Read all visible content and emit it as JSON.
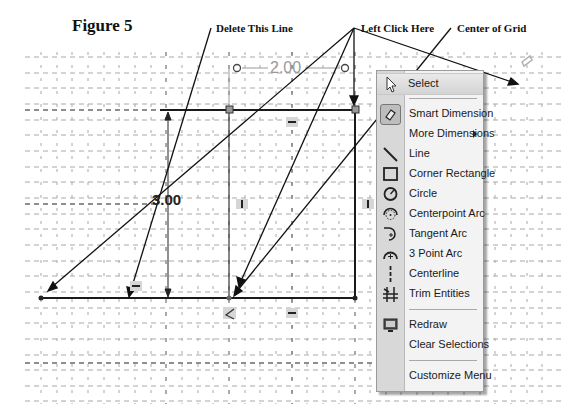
{
  "figure": {
    "title": "Figure 5"
  },
  "annotations": {
    "delete_line": "Delete This Line",
    "left_click": "Left Click Here",
    "center_grid": "Center of Grid"
  },
  "sketch": {
    "dimension_horizontal": "2.00",
    "dimension_vertical": "3.00",
    "line_color": "#1a1a1a",
    "grid_color": "#9a9a9a"
  },
  "context_menu": {
    "items": [
      {
        "label": "Select",
        "icon": "pointer-arrow-icon",
        "highlighted": true
      },
      {
        "label": "Smart Dimension",
        "icon": "smart-dimension-icon"
      },
      {
        "label": "More Dimensions",
        "icon": "",
        "submenu": true
      },
      {
        "label": "Line",
        "icon": "line-icon"
      },
      {
        "label": "Corner Rectangle",
        "icon": "rectangle-icon"
      },
      {
        "label": "Circle",
        "icon": "circle-icon"
      },
      {
        "label": "Centerpoint Arc",
        "icon": "centerpoint-arc-icon"
      },
      {
        "label": "Tangent Arc",
        "icon": "tangent-arc-icon"
      },
      {
        "label": "3 Point Arc",
        "icon": "three-point-arc-icon"
      },
      {
        "label": "Centerline",
        "icon": "centerline-icon"
      },
      {
        "label": "Trim Entities",
        "icon": "trim-entities-icon"
      },
      {
        "label": "Redraw",
        "icon": "redraw-icon"
      },
      {
        "label": "Clear Selections",
        "icon": ""
      },
      {
        "label": "Customize Menu",
        "icon": ""
      }
    ]
  }
}
